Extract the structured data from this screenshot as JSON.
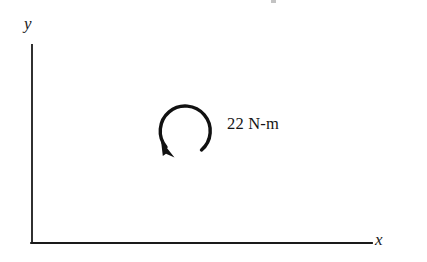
{
  "figure": {
    "type": "engineering-statics-free-body-diagram",
    "background_color": "#ffffff",
    "stroke_color": "#1a1a1a",
    "width": 427,
    "height": 262
  },
  "axes": {
    "y_axis_label": "y",
    "x_axis_label": "x",
    "origin": {
      "x": 32,
      "y": 243
    },
    "y_axis_top": {
      "x": 32,
      "y": 45
    },
    "x_axis_right": {
      "x": 372,
      "y": 243
    },
    "tick_labels": [],
    "gridlines": false
  },
  "moment": {
    "value_label": "22 N-m",
    "magnitude": 22,
    "units": "N-m",
    "sense": "clockwise",
    "arrow_center": {
      "x": 183,
      "y": 130
    },
    "arrow_radius": 25,
    "arrowhead_position": "bottom-left"
  },
  "icons": {
    "curved-moment-arrow-icon": "circular-arc-with-arrowhead"
  }
}
